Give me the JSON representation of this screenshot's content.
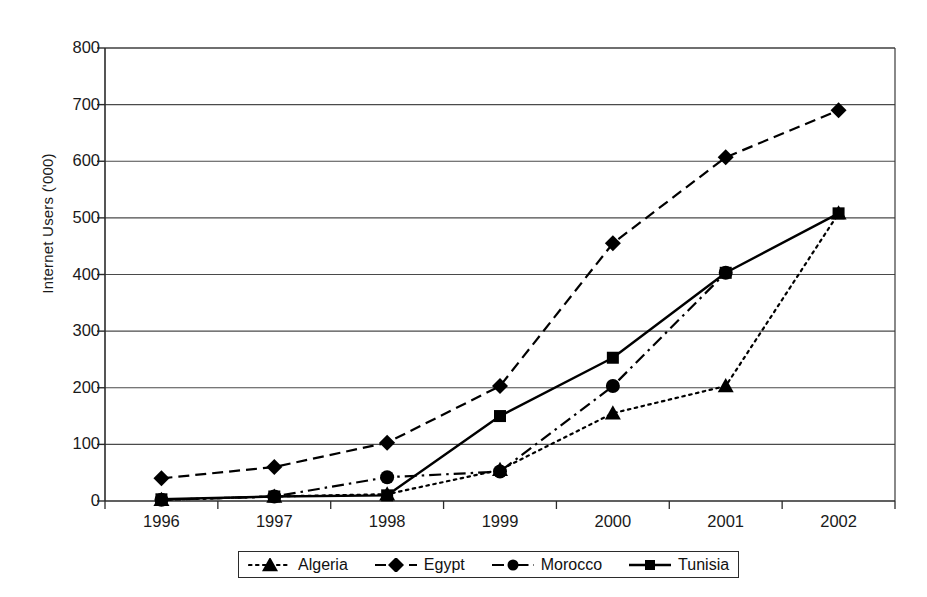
{
  "chart_data": {
    "type": "line",
    "title": "",
    "xlabel": "",
    "ylabel": "Internet Users ('000)",
    "categories": [
      "1996",
      "1997",
      "1998",
      "1999",
      "2000",
      "2001",
      "2002"
    ],
    "ylim": [
      0,
      800
    ],
    "ytick_labels": [
      "0",
      "100",
      "200",
      "300",
      "400",
      "500",
      "600",
      "700",
      "800"
    ],
    "ytick_values": [
      0,
      100,
      200,
      300,
      400,
      500,
      600,
      700,
      800
    ],
    "grid": "horizontal",
    "legend_position": "bottom",
    "series": [
      {
        "name": "Algeria",
        "marker": "triangle",
        "line_style": "dotted",
        "color": "#000000",
        "values": [
          2,
          8,
          12,
          55,
          155,
          203,
          508
        ]
      },
      {
        "name": "Egypt",
        "marker": "diamond",
        "line_style": "dashed",
        "color": "#000000",
        "values": [
          40,
          60,
          103,
          203,
          455,
          607,
          690
        ]
      },
      {
        "name": "Morocco",
        "marker": "circle",
        "line_style": "dash-dot",
        "color": "#000000",
        "values": [
          2,
          8,
          42,
          52,
          203,
          403,
          null
        ]
      },
      {
        "name": "Tunisia",
        "marker": "square",
        "line_style": "solid",
        "color": "#000000",
        "values": [
          3,
          8,
          10,
          150,
          253,
          403,
          508
        ]
      }
    ]
  },
  "axes": {
    "plot_left": 105,
    "plot_right": 895,
    "plot_top": 48,
    "plot_bottom": 501
  },
  "legend": {
    "items": [
      {
        "label": "Algeria"
      },
      {
        "label": "Egypt"
      },
      {
        "label": "Morocco"
      },
      {
        "label": "Tunisia"
      }
    ]
  }
}
